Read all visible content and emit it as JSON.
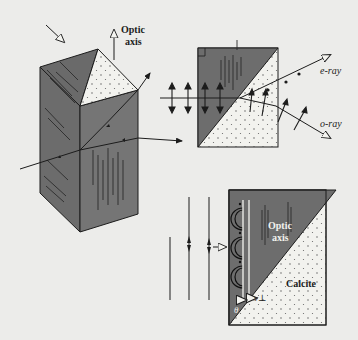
{
  "figure": {
    "colors": {
      "background": "#ececea",
      "crystal_dark": "#6e6e6e",
      "crystal_light_face": "#f2f2ee",
      "line": "#1c1c1c",
      "hatch": "#2e2e2e"
    }
  },
  "panel_crystal": {
    "optic_axis_label_line1": "Optic",
    "optic_axis_label_line2": "axis"
  },
  "panel_split": {
    "e_ray_label": "e-ray",
    "o_ray_label": "o-ray"
  },
  "panel_wavelets": {
    "optic_axis_label_line1": "Optic",
    "optic_axis_label_line2": "axis",
    "material_label": "Calcite",
    "v_parallel_label": "v∥",
    "v_perp_label": "v⊥",
    "angle_label": "θ"
  }
}
